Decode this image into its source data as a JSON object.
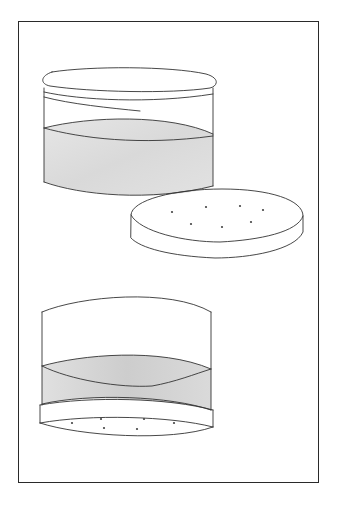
{
  "figure": {
    "title": "Container with lid and perforated disc insert",
    "colors": {
      "background": "#ffffff",
      "line": "#333333",
      "frame": "#2a2a2a",
      "liquid_fill": "#dcdcdc",
      "liquid_fill_dark": "#cfcfcf"
    },
    "views": [
      {
        "name": "upper-view",
        "components": [
          "lid",
          "jar-body",
          "liquid",
          "perforated-disc"
        ],
        "disc_hole_count": 7
      },
      {
        "name": "lower-view",
        "components": [
          "open-jar-body",
          "liquid-layer",
          "perforated-disc-base"
        ],
        "disc_hole_count": 6
      }
    ]
  }
}
